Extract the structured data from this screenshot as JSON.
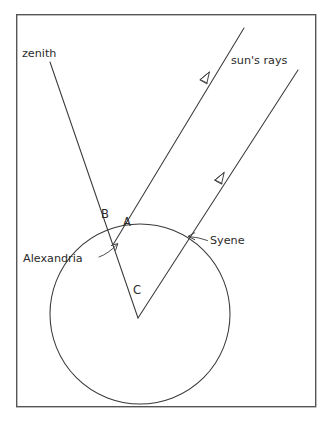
{
  "figure": {
    "background_color": "#ffffff",
    "ink_color": "#3a3a3a",
    "frame_color": "#555555"
  },
  "labels": {
    "zenith": "zenith",
    "suns_rays": "sun's rays",
    "alexandria": "Alexandria",
    "syene": "Syene",
    "vertex_b": "B",
    "vertex_a": "A",
    "vertex_c": "C"
  },
  "geometry": {
    "frame": {
      "x": 16,
      "y": 14,
      "width": 300,
      "height": 393
    },
    "globe": {
      "cx": 140,
      "cy": 314,
      "r": 90
    },
    "center_point": {
      "x": 138,
      "y": 318
    },
    "alexandria_point": {
      "x": 115,
      "y": 242
    },
    "syene_point": {
      "x": 193,
      "y": 236
    },
    "zenith_line": {
      "x1": 50,
      "y1": 62,
      "x2": 138,
      "y2": 318
    },
    "ray_to_alexandria": {
      "x1": 244,
      "y1": 28,
      "x2": 115,
      "y2": 242
    },
    "ray_to_syene": {
      "x1": 298,
      "y1": 70,
      "x2": 138,
      "y2": 318
    },
    "ray_arrow_1": {
      "x": 207,
      "y": 75
    },
    "ray_arrow_2": {
      "x": 222,
      "y": 175
    },
    "alexandria_pointer": {
      "x1": 99,
      "y1": 256,
      "x2": 118,
      "y2": 243
    },
    "syene_pointer": {
      "x1": 207,
      "y1": 239,
      "x2": 188,
      "y2": 236
    }
  },
  "text_positions": {
    "zenith": {
      "x": 22,
      "y": 57
    },
    "suns_rays": {
      "x": 231,
      "y": 64
    },
    "alexandria": {
      "x": 24,
      "y": 262
    },
    "syene": {
      "x": 210,
      "y": 244
    },
    "vertex_b": {
      "x": 102,
      "y": 218
    },
    "vertex_a": {
      "x": 124,
      "y": 225
    },
    "vertex_c": {
      "x": 133,
      "y": 293
    }
  }
}
